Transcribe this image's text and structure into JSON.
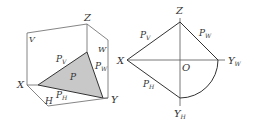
{
  "diagram": {
    "type": "orthographic projection of a plane",
    "left_figure": {
      "title": "3D view",
      "planes": [
        "V",
        "W",
        "H"
      ],
      "axes": [
        "X",
        "Y",
        "Z"
      ],
      "plane_label": "P",
      "traces": [
        {
          "name": "P",
          "sub": "V"
        },
        {
          "name": "P",
          "sub": "W"
        },
        {
          "name": "P",
          "sub": "H"
        }
      ],
      "labels": {
        "Z": "Z",
        "V": "V",
        "W": "W",
        "X": "X",
        "Y": "Y",
        "H": "H",
        "P": "P",
        "PV_main": "P",
        "PV_sub": "V",
        "PW_main": "P",
        "PW_sub": "W",
        "PH_main": "P",
        "PH_sub": "H"
      },
      "fill_color": "#c8c8c8"
    },
    "right_figure": {
      "title": "projection view",
      "labels": {
        "Z": "Z",
        "X": "X",
        "O": "O",
        "YW_main": "Y",
        "YW_sub": "W",
        "YH_main": "Y",
        "YH_sub": "H",
        "PV_main": "P",
        "PV_sub": "V",
        "PW_main": "P",
        "PW_sub": "W",
        "PH_main": "P",
        "PH_sub": "H"
      }
    },
    "line_color": "#555555"
  }
}
